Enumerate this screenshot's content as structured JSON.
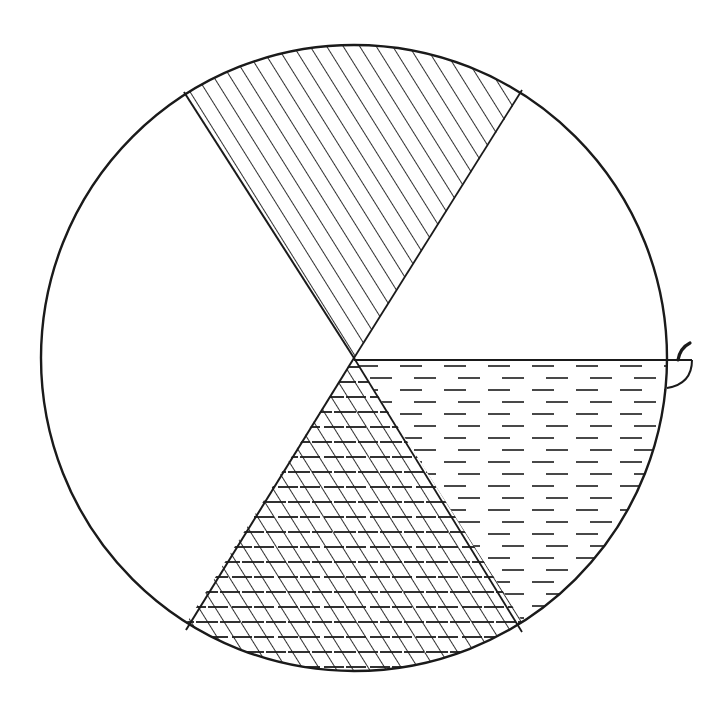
{
  "figure": {
    "type": "sector-circle-diagram",
    "stroke_color": "#1a1a1a",
    "background": "#ffffff",
    "circle": {
      "cx": 354,
      "cy": 358,
      "r": 313
    },
    "sectors": [
      {
        "name": "top",
        "from_deg": 58,
        "to_deg": 122,
        "fill": "diagonal-hatch"
      },
      {
        "name": "upper-left",
        "from_deg": 122,
        "to_deg": 238,
        "fill": "blank"
      },
      {
        "name": "bottom-left",
        "from_deg": 238,
        "to_deg": 302,
        "fill": "cross-hatch"
      },
      {
        "name": "bottom-right",
        "from_deg": 302,
        "to_deg": 360,
        "fill": "horizontal-dashes"
      },
      {
        "name": "upper-right",
        "from_deg": 0,
        "to_deg": 58,
        "fill": "blank"
      }
    ],
    "attachment": {
      "name": "bowl-with-spoon",
      "position": "right-edge"
    }
  },
  "caption": {
    "text": ""
  }
}
